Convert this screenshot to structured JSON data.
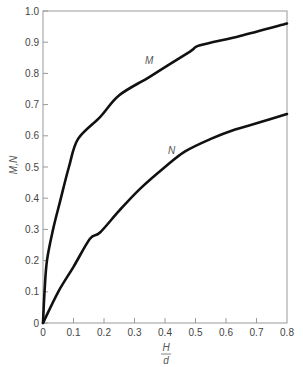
{
  "chart_data": {
    "type": "line",
    "title": "",
    "xlabel": "H/d",
    "xlabel_numerator": "H",
    "xlabel_denominator": "d",
    "ylabel": "M,N",
    "xlim": [
      0,
      0.8
    ],
    "ylim": [
      0,
      1.0
    ],
    "grid": false,
    "legend": "none (curves labeled inline)",
    "x_ticks": [
      "0",
      "0.1",
      "0.2",
      "0.3",
      "0.4",
      "0.5",
      "0.6",
      "0.7",
      "0.8"
    ],
    "y_ticks": [
      "0",
      "0.1",
      "0.2",
      "0.3",
      "0.4",
      "0.5",
      "0.6",
      "0.7",
      "0.8",
      "0.9",
      "1.0"
    ],
    "series": [
      {
        "name": "M",
        "x": [
          0,
          0.005,
          0.013,
          0.033,
          0.056,
          0.085,
          0.115,
          0.187,
          0.25,
          0.351,
          0.482,
          0.515,
          0.646,
          0.8
        ],
        "y": [
          0,
          0.1,
          0.2,
          0.3,
          0.39,
          0.5,
          0.59,
          0.66,
          0.73,
          0.79,
          0.87,
          0.89,
          0.92,
          0.96
        ],
        "label_position": {
          "x": 0.34,
          "y": 0.84
        }
      },
      {
        "name": "N",
        "x": [
          0,
          0.05,
          0.1,
          0.154,
          0.187,
          0.25,
          0.318,
          0.4,
          0.466,
          0.55,
          0.63,
          0.7,
          0.8
        ],
        "y": [
          0,
          0.1,
          0.18,
          0.27,
          0.29,
          0.36,
          0.43,
          0.5,
          0.55,
          0.59,
          0.62,
          0.64,
          0.67
        ],
        "label_position": {
          "x": 0.42,
          "y": 0.55
        }
      }
    ]
  },
  "labels": {
    "ylabel": "M,N",
    "x_num": "H",
    "x_den": "d",
    "curve_m": "M",
    "curve_n": "N"
  }
}
